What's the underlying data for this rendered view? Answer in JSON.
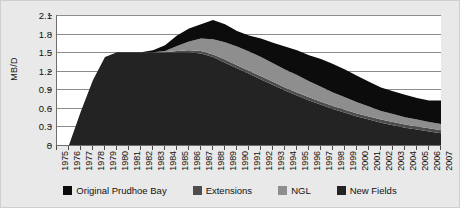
{
  "chart_data": {
    "type": "area",
    "stacked": true,
    "title": "",
    "subtitle": "",
    "xlabel": "",
    "ylabel": "MB/D",
    "ylim": [
      0,
      2.1
    ],
    "ytick_values": [
      0,
      0.3,
      0.6,
      0.9,
      1.2,
      1.5,
      1.8,
      2.1
    ],
    "ytick_labels": [
      "0",
      "0.3",
      "0.6",
      "0.9",
      "1.2",
      "1.5",
      "1.8",
      "2.1"
    ],
    "grid": true,
    "legend_position": "bottom",
    "x": [
      1975,
      1976,
      1977,
      1978,
      1979,
      1980,
      1981,
      1982,
      1983,
      1984,
      1985,
      1986,
      1987,
      1988,
      1989,
      1990,
      1991,
      1992,
      1993,
      1994,
      1995,
      1996,
      1997,
      1998,
      1999,
      2000,
      2001,
      2002,
      2003,
      2004,
      2005,
      2006,
      2007
    ],
    "categories": [
      "1975",
      "1976",
      "1977",
      "1978",
      "1979",
      "1980",
      "1981",
      "1982",
      "1983",
      "1984",
      "1985",
      "1986",
      "1987",
      "1988",
      "1989",
      "1990",
      "1991",
      "1992",
      "1993",
      "1994",
      "1995",
      "1996",
      "1997",
      "1998",
      "1999",
      "2000",
      "2001",
      "2002",
      "2003",
      "2004",
      "2005",
      "2006",
      "2007"
    ],
    "series": [
      {
        "name": "Original Prudhoe Bay",
        "color": "#232323",
        "values": [
          0.0,
          0.0,
          0.55,
          1.05,
          1.42,
          1.5,
          1.5,
          1.5,
          1.5,
          1.5,
          1.5,
          1.5,
          1.48,
          1.42,
          1.33,
          1.24,
          1.15,
          1.06,
          0.97,
          0.88,
          0.8,
          0.72,
          0.65,
          0.58,
          0.52,
          0.46,
          0.41,
          0.36,
          0.32,
          0.28,
          0.25,
          0.22,
          0.19
        ]
      },
      {
        "name": "Extensions",
        "color": "#4d4d4d",
        "values": [
          0.0,
          0.0,
          0.0,
          0.0,
          0.0,
          0.0,
          0.0,
          0.0,
          0.0,
          0.0,
          0.02,
          0.03,
          0.04,
          0.04,
          0.05,
          0.05,
          0.05,
          0.05,
          0.05,
          0.05,
          0.05,
          0.05,
          0.05,
          0.05,
          0.05,
          0.05,
          0.05,
          0.05,
          0.05,
          0.05,
          0.05,
          0.05,
          0.05
        ]
      },
      {
        "name": "NGL",
        "color": "#8e8e8e",
        "values": [
          0.0,
          0.0,
          0.0,
          0.0,
          0.0,
          0.0,
          0.0,
          0.0,
          0.0,
          0.02,
          0.08,
          0.14,
          0.2,
          0.25,
          0.28,
          0.3,
          0.31,
          0.31,
          0.3,
          0.29,
          0.28,
          0.26,
          0.24,
          0.22,
          0.2,
          0.18,
          0.16,
          0.14,
          0.13,
          0.12,
          0.11,
          0.1,
          0.1
        ]
      },
      {
        "name": "New Fields",
        "color": "#0c0c0c",
        "values": [
          0.0,
          0.0,
          0.0,
          0.0,
          0.0,
          0.0,
          0.0,
          0.0,
          0.03,
          0.09,
          0.17,
          0.21,
          0.23,
          0.31,
          0.29,
          0.25,
          0.26,
          0.3,
          0.33,
          0.37,
          0.4,
          0.42,
          0.45,
          0.46,
          0.45,
          0.43,
          0.4,
          0.38,
          0.37,
          0.36,
          0.35,
          0.35,
          0.38
        ]
      }
    ],
    "totals": [
      0.0,
      0.0,
      0.55,
      1.05,
      1.42,
      1.5,
      1.5,
      1.5,
      1.53,
      1.61,
      1.77,
      1.88,
      1.95,
      2.02,
      1.95,
      1.84,
      1.77,
      1.72,
      1.65,
      1.59,
      1.53,
      1.45,
      1.39,
      1.31,
      1.22,
      1.12,
      1.02,
      0.93,
      0.87,
      0.81,
      0.76,
      0.72,
      0.72
    ]
  },
  "legend": {
    "items": [
      {
        "label": "Original Prudhoe Bay",
        "color": "#0c0c0c",
        "icon": "legend-swatch-icon"
      },
      {
        "label": "Extensions",
        "color": "#4d4d4d",
        "icon": "legend-swatch-icon"
      },
      {
        "label": "NGL",
        "color": "#8e8e8e",
        "icon": "legend-swatch-icon"
      },
      {
        "label": "New Fields",
        "color": "#232323",
        "icon": "legend-swatch-icon"
      }
    ]
  },
  "colors": {
    "figure_background": "#e9e9e9",
    "plot_background": "#ffffff",
    "gridline": "#8c8c8c",
    "axis": "#6d6d6d",
    "text": "#111111"
  }
}
